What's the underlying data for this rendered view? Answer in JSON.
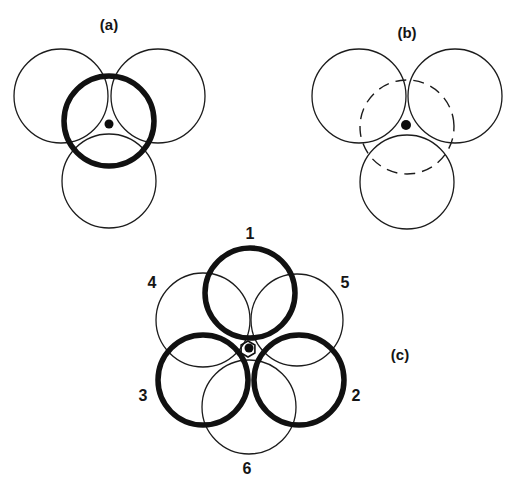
{
  "figure": {
    "panels": [
      {
        "id": "a",
        "label": "(a)",
        "label_pos": [
          109,
          30
        ],
        "thin_circles": [
          {
            "cx": 61,
            "cy": 96,
            "r": 47
          },
          {
            "cx": 158,
            "cy": 96,
            "r": 47
          },
          {
            "cx": 109,
            "cy": 181,
            "r": 47
          }
        ],
        "thick_circles": [
          {
            "cx": 109,
            "cy": 121,
            "r": 45
          }
        ],
        "dashed_circles": [],
        "dot": {
          "cx": 109,
          "cy": 124,
          "r": 4.5
        }
      },
      {
        "id": "b",
        "label": "(b)",
        "label_pos": [
          407,
          38
        ],
        "thin_circles": [
          {
            "cx": 359,
            "cy": 96,
            "r": 47
          },
          {
            "cx": 455,
            "cy": 96,
            "r": 47
          },
          {
            "cx": 407,
            "cy": 182,
            "r": 47
          }
        ],
        "thick_circles": [],
        "dashed_circles": [
          {
            "cx": 407,
            "cy": 127,
            "r": 47
          }
        ],
        "dot": {
          "cx": 406,
          "cy": 125,
          "r": 5
        }
      },
      {
        "id": "c",
        "label": "(c)",
        "label_pos": [
          400,
          360
        ],
        "thin_circles": [
          {
            "cx": 203,
            "cy": 320,
            "r": 47,
            "number": "4",
            "number_pos": [
              152,
              288
            ]
          },
          {
            "cx": 297,
            "cy": 320,
            "r": 46,
            "number": "5",
            "number_pos": [
              345,
              288
            ]
          },
          {
            "cx": 249,
            "cy": 407,
            "r": 47,
            "number": "6",
            "number_pos": [
              247,
              474
            ]
          }
        ],
        "thick_circles": [
          {
            "cx": 250,
            "cy": 293,
            "r": 45,
            "number": "1",
            "number_pos": [
              250,
              239
            ]
          },
          {
            "cx": 299,
            "cy": 380,
            "r": 45,
            "number": "2",
            "number_pos": [
              356,
              401
            ]
          },
          {
            "cx": 203,
            "cy": 380,
            "r": 45,
            "number": "3",
            "number_pos": [
              143,
              401
            ]
          }
        ],
        "dashed_circles": [],
        "dot": {
          "cx": 249,
          "cy": 348,
          "r": 4.5
        },
        "hexagon": {
          "cx": 248,
          "cy": 349,
          "r": 8
        }
      }
    ]
  }
}
